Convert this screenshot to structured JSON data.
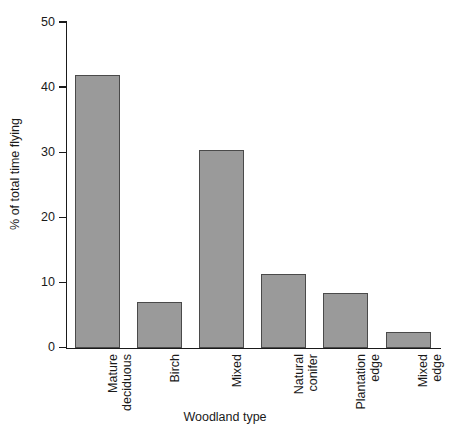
{
  "chart_data": {
    "type": "bar",
    "title": "",
    "xlabel": "Woodland type",
    "ylabel": "% of total time flying",
    "categories": [
      "Mature deciduous",
      "Birch",
      "Mixed",
      "Natural conifer",
      "Plantation edge",
      "Mixed edge"
    ],
    "category_lines": [
      [
        "Mature",
        "deciduous"
      ],
      [
        "Birch",
        ""
      ],
      [
        "Mixed",
        ""
      ],
      [
        "Natural",
        "conifer"
      ],
      [
        "Plantation",
        "edge"
      ],
      [
        "Mixed",
        "edge"
      ]
    ],
    "values": [
      42.0,
      7.1,
      30.4,
      11.3,
      8.4,
      2.5
    ],
    "ylim": [
      0,
      50
    ],
    "yticks": [
      0,
      10,
      20,
      30,
      40,
      50
    ],
    "ytick_labels": [
      "0",
      "10",
      "20",
      "30",
      "40",
      "50"
    ],
    "grid": false,
    "legend": null,
    "bar_color": "#9a9a9a",
    "bar_edge_color": "#4a4a4a",
    "axis_color": "#1a1a1a"
  }
}
